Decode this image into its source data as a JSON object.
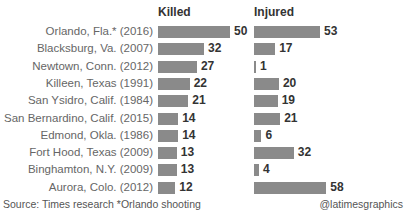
{
  "headers": {
    "killed": "Killed",
    "injured": "Injured"
  },
  "chart_data": {
    "type": "bar",
    "title": "",
    "categories": [
      "Orlando, Fla.* (2016)",
      "Blacksburg, Va. (2007)",
      "Newtown, Conn. (2012)",
      "Killeen, Texas (1991)",
      "San Ysidro, Calif. (1984)",
      "San Bernardino, Calif. (2015)",
      "Edmond, Okla. (1986)",
      "Fort Hood, Texas (2009)",
      "Binghamton, N.Y. (2009)",
      "Aurora, Colo. (2012)"
    ],
    "series": [
      {
        "name": "Killed",
        "values": [
          50,
          32,
          27,
          22,
          21,
          14,
          14,
          13,
          13,
          12
        ]
      },
      {
        "name": "Injured",
        "values": [
          53,
          17,
          1,
          20,
          19,
          21,
          6,
          32,
          4,
          58
        ]
      }
    ],
    "orientation": "horizontal",
    "bar_color": "#8a8a8a"
  },
  "footer": {
    "source": "Source: Times research *Orlando shooting",
    "credit": "@latimesgraphics"
  }
}
